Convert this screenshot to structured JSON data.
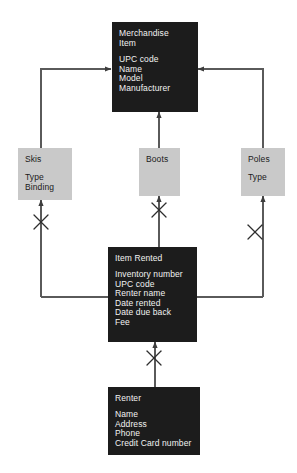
{
  "diagram": {
    "colors": {
      "dark_entity_fill": "#1c1c1c",
      "dark_entity_text": "#f2f2f2",
      "light_entity_fill": "#c9c9c9",
      "light_entity_text": "#1a1a1a",
      "line": "#4a4a4a",
      "background": "#ffffff"
    },
    "entities": [
      {
        "id": "merchandise-item",
        "title": "Merchandise\nItem",
        "attributes": [
          "UPC code",
          "Name",
          "Model",
          "Manufacturer"
        ],
        "style": "dark"
      },
      {
        "id": "skis",
        "title": "Skis",
        "attributes": [
          "Type",
          "Binding"
        ],
        "style": "light"
      },
      {
        "id": "boots",
        "title": "Boots",
        "attributes": [],
        "style": "light"
      },
      {
        "id": "poles",
        "title": "Poles",
        "attributes": [
          "Type"
        ],
        "style": "light"
      },
      {
        "id": "item-rented",
        "title": "Item Rented",
        "attributes": [
          "Inventory number",
          "UPC code",
          "Renter name",
          "Date rented",
          "Date due back",
          "Fee"
        ],
        "style": "dark"
      },
      {
        "id": "renter",
        "title": "Renter",
        "attributes": [
          "Name",
          "Address",
          "Phone",
          "Credit Card number"
        ],
        "style": "dark"
      }
    ],
    "relationships": [
      {
        "from": "skis",
        "to": "merchandise-item",
        "marker": "crossed-x"
      },
      {
        "from": "boots",
        "to": "merchandise-item",
        "marker": "crossed-x"
      },
      {
        "from": "poles",
        "to": "merchandise-item",
        "marker": "crossed-x"
      },
      {
        "from": "item-rented",
        "to": "skis",
        "marker": "crossed-x"
      },
      {
        "from": "item-rented",
        "to": "boots",
        "marker": "crossed-x"
      },
      {
        "from": "item-rented",
        "to": "poles",
        "marker": "crossed-x"
      },
      {
        "from": "renter",
        "to": "item-rented",
        "marker": "crossed-x"
      }
    ]
  }
}
